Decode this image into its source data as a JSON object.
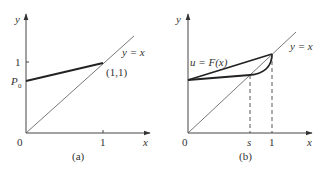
{
  "figure": {
    "panels": [
      {
        "id": "a",
        "caption": "(a)",
        "axis_x_label": "x",
        "axis_y_label": "y",
        "origin_label": "0",
        "x_tick_label": "1",
        "y_tick_label": "1",
        "p0_label": "P",
        "p0_sub": "0",
        "diag_label": "y = x",
        "point_label": "(1,1)"
      },
      {
        "id": "b",
        "caption": "(b)",
        "axis_x_label": "x",
        "axis_y_label": "y",
        "origin_label": "0",
        "s_tick_label": "s",
        "x_tick_label": "1",
        "curve_label": "u = F(x)",
        "diag_label": "y = x"
      }
    ]
  }
}
